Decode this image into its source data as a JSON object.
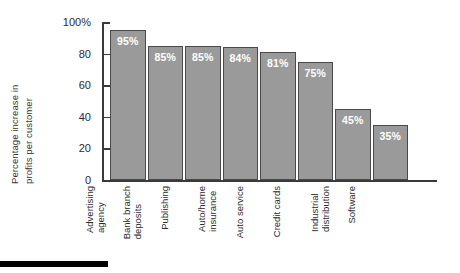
{
  "chart_data": {
    "type": "bar",
    "title": "",
    "xlabel": "",
    "ylabel": "Percentage increase in profits per customer",
    "ylabel_lines": [
      "Percentage increase in",
      "profits per customer"
    ],
    "ylim": [
      0,
      100
    ],
    "yticks": [
      {
        "value": 100,
        "label": "100%"
      },
      {
        "value": 80,
        "label": "80"
      },
      {
        "value": 60,
        "label": "60"
      },
      {
        "value": 40,
        "label": "40"
      },
      {
        "value": 20,
        "label": "20"
      },
      {
        "value": 0,
        "label": "0"
      }
    ],
    "grid": false,
    "legend": "none",
    "categories": [
      "Advertising agency",
      "Bank branch deposits",
      "Publishing",
      "Auto/home insurance",
      "Auto service",
      "Credit cards",
      "Industrial distribution",
      "Software"
    ],
    "category_lines": [
      [
        "Advertising",
        "agency"
      ],
      [
        "Bank branch",
        "deposits"
      ],
      [
        "Publishing"
      ],
      [
        "Auto/home",
        "insurance"
      ],
      [
        "Auto service"
      ],
      [
        "Credit cards"
      ],
      [
        "Industrial",
        "distribution"
      ],
      [
        "Software"
      ]
    ],
    "values": [
      95,
      85,
      85,
      84,
      81,
      75,
      45,
      35
    ],
    "value_labels": [
      "95%",
      "85%",
      "85%",
      "84%",
      "81%",
      "75%",
      "45%",
      "35%"
    ],
    "colors": {
      "bar_fill": "#9a9a9a",
      "bar_border": "#4a4a4a",
      "value_text": "#ffffff",
      "axis": "#3a3a3a",
      "text": "#2b2b2b",
      "background": "#ffffff",
      "footer_rule": "#000000"
    }
  }
}
